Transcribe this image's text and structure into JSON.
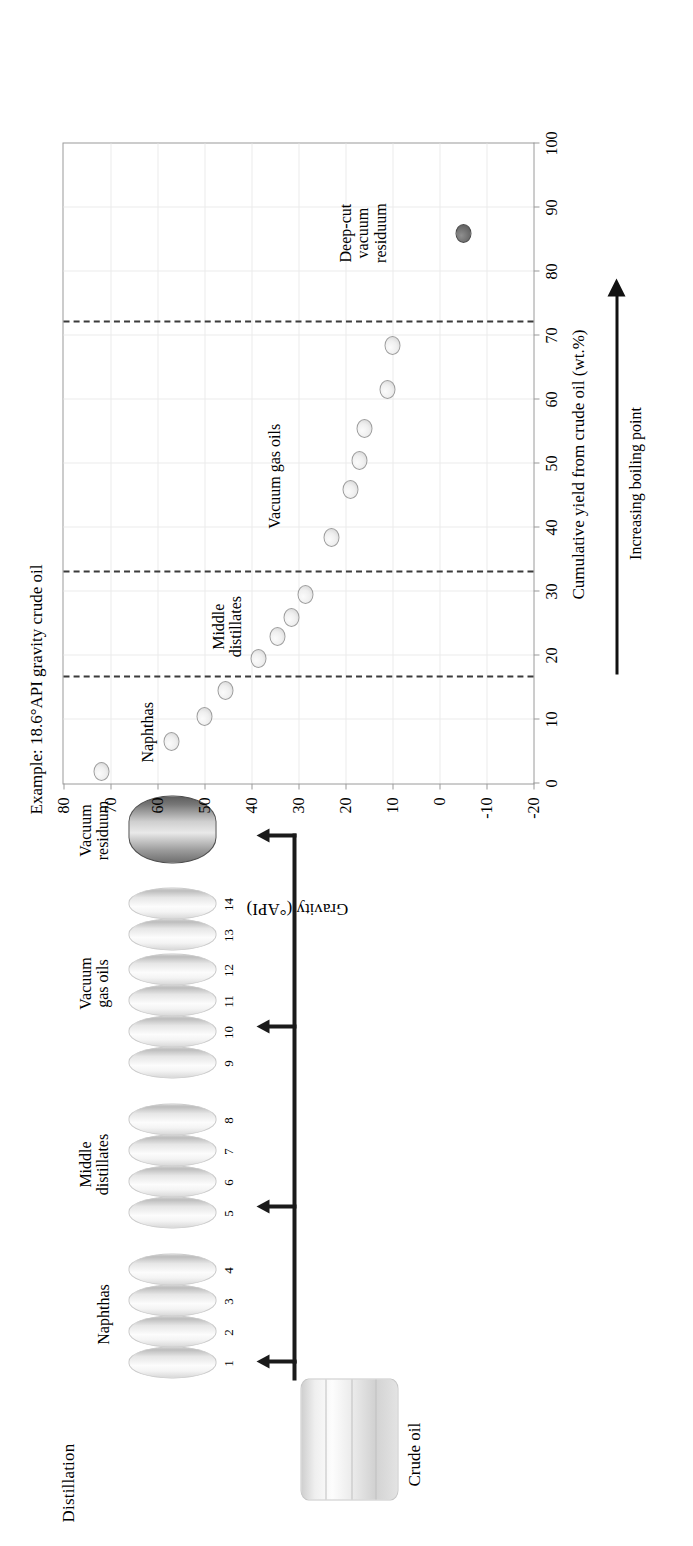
{
  "figure": {
    "schematic_title": "Distillation",
    "crude_label": "Crude oil",
    "groups": [
      {
        "label": "Naphthas",
        "numbers": [
          "1",
          "2",
          "3",
          "4"
        ]
      },
      {
        "label": "Middle\ndistillates",
        "numbers": [
          "5",
          "6",
          "7",
          "8"
        ]
      },
      {
        "label": "Vacuum\ngas oils",
        "numbers": [
          "9",
          "10",
          "11",
          "12",
          "13",
          "14"
        ]
      },
      {
        "label": "Vacuum\nresiduum",
        "numbers": []
      }
    ]
  },
  "chart_data": {
    "type": "scatter",
    "title": "Example: 18.6°API gravity crude oil",
    "xlabel": "Cumulative yield from crude oil (wt.%)",
    "ylabel": "Gravity (°API)",
    "xlim": [
      0,
      100
    ],
    "ylim": [
      -20,
      80
    ],
    "xticks": [
      "0",
      "10",
      "20",
      "30",
      "40",
      "50",
      "60",
      "70",
      "80",
      "90",
      "100"
    ],
    "yticks": [
      "80",
      "70",
      "60",
      "50",
      "40",
      "30",
      "20",
      "10",
      "0",
      "-10",
      "-20"
    ],
    "grid": true,
    "legend": "none",
    "series": [
      {
        "name": "Distillation cuts",
        "points": [
          {
            "cut": 1,
            "x": 1.8,
            "y": 72.0
          },
          {
            "cut": 2,
            "x": 6.5,
            "y": 57.0
          },
          {
            "cut": 3,
            "x": 10.5,
            "y": 50.0
          },
          {
            "cut": 4,
            "x": 14.5,
            "y": 45.5
          },
          {
            "cut": 5,
            "x": 19.5,
            "y": 38.5
          },
          {
            "cut": 6,
            "x": 23.0,
            "y": 34.5
          },
          {
            "cut": 7,
            "x": 26.0,
            "y": 31.5
          },
          {
            "cut": 8,
            "x": 29.5,
            "y": 28.5
          },
          {
            "cut": 9,
            "x": 38.5,
            "y": 23.0
          },
          {
            "cut": 10,
            "x": 46.0,
            "y": 19.0
          },
          {
            "cut": 11,
            "x": 50.5,
            "y": 17.0
          },
          {
            "cut": 12,
            "x": 55.5,
            "y": 16.0
          },
          {
            "cut": 13,
            "x": 61.5,
            "y": 11.0
          },
          {
            "cut": 14,
            "x": 68.5,
            "y": 10.0
          }
        ]
      },
      {
        "name": "Deep-cut vacuum residuum",
        "points": [
          {
            "cut": 15,
            "x": 86.0,
            "y": -5.0
          }
        ]
      }
    ],
    "cut_lines": [
      16.5,
      33.0,
      72.0
    ],
    "annotations": [
      {
        "text": "Naphthas",
        "x": 8.0,
        "y": 64.0
      },
      {
        "text": "Middle\ndistillates",
        "x": 24.5,
        "y": 49.0
      },
      {
        "text": "Vacuum gas oils",
        "x": 48.0,
        "y": 37.0
      },
      {
        "text": "Deep-cut\nvacuum\nresiduum",
        "x": 86.0,
        "y": 22.0
      }
    ],
    "boiling_point_note": "Increasing boiling point"
  },
  "colors": {
    "axis": "#9a9a9a",
    "grid": "#ececec",
    "cut_line": "#3b3b3b",
    "marker_light": "#efefef",
    "marker_dark": "#6e6e6e",
    "ink": "#111111"
  }
}
